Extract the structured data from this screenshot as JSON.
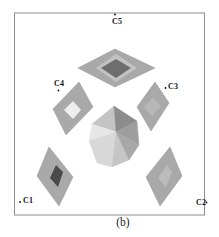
{
  "figure": {
    "caption": "(b)",
    "labels": {
      "c5": "C5",
      "c4": "C4",
      "c3": "C3",
      "c2": "C2",
      "c1": "C1"
    },
    "colors": {
      "background": "#ffffff",
      "frame_border": "#8e8e8e",
      "plane_fill": "#a9a9a9",
      "plane_edge": "#949494",
      "label_text": "#141414",
      "marker_dot": "#111111"
    },
    "frame": {
      "x": 14.5,
      "y": 13,
      "width": 190,
      "height": 202
    },
    "planes": [
      {
        "name": "plane-c5",
        "outer": "115,49 155,68 115,87 78,68",
        "mid": "116,54 137,68 116,82 96,68",
        "mid_fill": "#c2c2c2",
        "inner": "116,59 131,68 116,78 101,68",
        "inner_fill": "#6e6e6e"
      },
      {
        "name": "plane-c4",
        "outer": "79,82 93,107 66,135 53,109",
        "inner": "73,101 81,110 73,119 64,110",
        "inner_fill": "#eeeeee"
      },
      {
        "name": "plane-c3",
        "outer": "155,82 169,103 151,131 137,107",
        "inner": "153,97 161,106 152,116 144,107",
        "inner_fill": "#b7b7b7"
      },
      {
        "name": "plane-c1",
        "outer": "49,147 73,177 59,206 37,176",
        "inner": "56,165 63,172 58,187 50,178",
        "inner_fill": "#4a4a4a"
      },
      {
        "name": "plane-c2",
        "outer": "170,147 182,176 160,206 146,177",
        "inner": "167,165 172,172 166,187 158,178",
        "inner_fill": "#bcbcbc"
      }
    ],
    "crystal": {
      "name": "central-crystal",
      "facets": [
        {
          "points": "114,106 92,124 116,132",
          "fill": "#c4c4c4"
        },
        {
          "points": "114,106 116,132 137,121",
          "fill": "#8c8c8c"
        },
        {
          "points": "92,124 89,141 116,132",
          "fill": "#e6e6e6"
        },
        {
          "points": "137,121 116,132 139,145",
          "fill": "#9e9e9e"
        },
        {
          "points": "89,141 97,163 112,167 116,132",
          "fill": "#d8d8d8"
        },
        {
          "points": "116,132 112,167 129,160",
          "fill": "#c6c6c6"
        },
        {
          "points": "116,132 129,160 139,145",
          "fill": "#a8a8a8"
        }
      ]
    },
    "markers": [
      {
        "name": "marker-c5",
        "x": 115,
        "y": 14.5
      },
      {
        "name": "marker-c4",
        "x": 58.5,
        "y": 90.5
      },
      {
        "name": "marker-c3",
        "x": 165.5,
        "y": 88
      },
      {
        "name": "marker-c1",
        "x": 20,
        "y": 202
      },
      {
        "name": "marker-c2",
        "x": 206.5,
        "y": 202.5
      }
    ]
  }
}
